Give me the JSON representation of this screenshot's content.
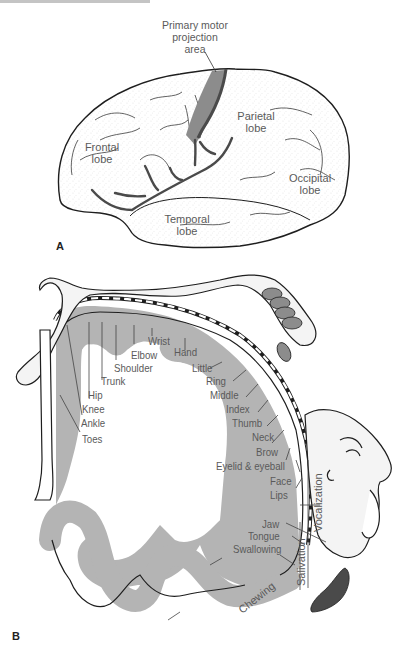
{
  "panel_a": {
    "letter": "A",
    "labels": {
      "primary_motor": [
        "Primary motor",
        "projection",
        "area"
      ],
      "frontal": [
        "Frontal",
        "lobe"
      ],
      "parietal": [
        "Parietal",
        "lobe"
      ],
      "occipital": [
        "Occipital",
        "lobe"
      ],
      "temporal": [
        "Temporal",
        "lobe"
      ]
    }
  },
  "panel_b": {
    "letter": "B",
    "body_labels": [
      "Toes",
      "Ankle",
      "Knee",
      "Hip",
      "Trunk",
      "Shoulder",
      "Elbow",
      "Wrist",
      "Hand",
      "Little",
      "Ring",
      "Middle",
      "Index",
      "Thumb",
      "Neck",
      "Brow",
      "Eyelid & eyeball",
      "Face",
      "Lips",
      "Jaw",
      "Tongue",
      "Swallowing"
    ],
    "vertical_labels": {
      "vocalization": "Vocalization",
      "salivation": "Salivation",
      "chewing": "Chewing"
    }
  },
  "colors": {
    "motor_area": "#8c8c8c",
    "cortex_band": "#b4b4b4",
    "sulcus": "#4a4a4a",
    "outline": "#1e1e1e",
    "label_text": "#5a5a5a"
  }
}
